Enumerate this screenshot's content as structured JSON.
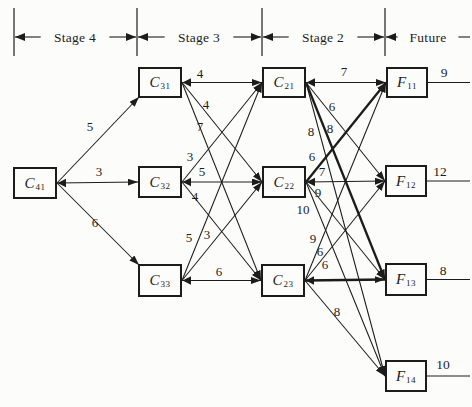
{
  "diagram": {
    "colors": {
      "ink": "#1c1c1c",
      "paper": "#fcfcfa"
    },
    "header": {
      "axis_y": 37,
      "tick_top": 8,
      "tick_bottom": 56,
      "ticks_x": [
        14,
        137,
        262,
        385
      ],
      "right_edge": 470,
      "segments": [
        {
          "label": "Stage 4",
          "from": 14,
          "to": 137,
          "cx": 75,
          "arrows": "both"
        },
        {
          "label": "Stage 3",
          "from": 137,
          "to": 262,
          "cx": 199,
          "arrows": "both"
        },
        {
          "label": "Stage 2",
          "from": 262,
          "to": 385,
          "cx": 323,
          "arrows": "both"
        },
        {
          "label": "Future",
          "from": 385,
          "to": 470,
          "cx": 428,
          "arrows": "left"
        }
      ]
    },
    "nodes": [
      {
        "id": "C41",
        "main": "C",
        "sub": "41",
        "x": 13,
        "y": 167,
        "w": 44,
        "h": 32
      },
      {
        "id": "C31",
        "main": "C",
        "sub": "31",
        "x": 138,
        "y": 67,
        "w": 44,
        "h": 31
      },
      {
        "id": "C32",
        "main": "C",
        "sub": "32",
        "x": 138,
        "y": 166,
        "w": 44,
        "h": 32
      },
      {
        "id": "C33",
        "main": "C",
        "sub": "33",
        "x": 138,
        "y": 264,
        "w": 44,
        "h": 33
      },
      {
        "id": "C21",
        "main": "C",
        "sub": "21",
        "x": 262,
        "y": 67,
        "w": 44,
        "h": 31
      },
      {
        "id": "C22",
        "main": "C",
        "sub": "22",
        "x": 262,
        "y": 166,
        "w": 44,
        "h": 32
      },
      {
        "id": "C23",
        "main": "C",
        "sub": "23",
        "x": 261,
        "y": 264,
        "w": 44,
        "h": 33
      },
      {
        "id": "F11",
        "main": "F",
        "sub": "11",
        "x": 386,
        "y": 67,
        "w": 42,
        "h": 31
      },
      {
        "id": "F12",
        "main": "F",
        "sub": "12",
        "x": 385,
        "y": 165,
        "w": 42,
        "h": 32
      },
      {
        "id": "F13",
        "main": "F",
        "sub": "13",
        "x": 385,
        "y": 263,
        "w": 42,
        "h": 33
      },
      {
        "id": "F14",
        "main": "F",
        "sub": "14",
        "x": 385,
        "y": 360,
        "w": 42,
        "h": 32
      }
    ],
    "edges": [
      {
        "from": "C41",
        "to": "C31",
        "label": "5",
        "lx": 90,
        "ly": 126,
        "anchor": "bl"
      },
      {
        "from": "C41",
        "to": "C32",
        "label": "3",
        "lx": 99,
        "ly": 171
      },
      {
        "from": "C41",
        "to": "C33",
        "label": "6",
        "lx": 95,
        "ly": 222,
        "anchor": "tl"
      },
      {
        "from": "C31",
        "to": "C21",
        "label": "4",
        "lx": 200,
        "ly": 73
      },
      {
        "from": "C31",
        "to": "C22",
        "label": "4",
        "lx": 206,
        "ly": 104
      },
      {
        "from": "C31",
        "to": "C23",
        "label": "7",
        "lx": 200,
        "ly": 126
      },
      {
        "from": "C32",
        "to": "C21",
        "label": "3",
        "lx": 190,
        "ly": 156
      },
      {
        "from": "C32",
        "to": "C22",
        "label": "5",
        "lx": 202,
        "ly": 171
      },
      {
        "from": "C32",
        "to": "C23",
        "label": "4",
        "lx": 195,
        "ly": 196
      },
      {
        "from": "C33",
        "to": "C21",
        "label": "5",
        "lx": 189,
        "ly": 237
      },
      {
        "from": "C33",
        "to": "C22",
        "label": "3",
        "lx": 207,
        "ly": 234
      },
      {
        "from": "C33",
        "to": "C23",
        "label": "6",
        "lx": 219,
        "ly": 271
      },
      {
        "from": "C21",
        "to": "F11",
        "label": "7",
        "lx": 344,
        "ly": 71
      },
      {
        "from": "C21",
        "to": "F12",
        "label": "6",
        "lx": 332,
        "ly": 106
      },
      {
        "from": "C21",
        "to": "F13",
        "label": "8",
        "lx": 330,
        "ly": 128,
        "thick": true
      },
      {
        "from": "C21",
        "to": "F14",
        "label": "8",
        "lx": 311,
        "ly": 131
      },
      {
        "from": "C22",
        "to": "F11",
        "label": "6",
        "lx": 312,
        "ly": 156,
        "thick": true
      },
      {
        "from": "C22",
        "to": "F12",
        "label": "7",
        "lx": 322,
        "ly": 171
      },
      {
        "from": "C22",
        "to": "F13",
        "label": "9",
        "lx": 318,
        "ly": 192
      },
      {
        "from": "C22",
        "to": "F14",
        "label": "10",
        "lx": 303,
        "ly": 209
      },
      {
        "from": "C23",
        "to": "F11",
        "label": "9",
        "lx": 313,
        "ly": 238
      },
      {
        "from": "C23",
        "to": "F12",
        "label": "6",
        "lx": 320,
        "ly": 251
      },
      {
        "from": "C23",
        "to": "F13",
        "label": "6",
        "lx": 325,
        "ly": 264,
        "thick": true
      },
      {
        "from": "C23",
        "to": "F14",
        "label": "8",
        "lx": 337,
        "ly": 311
      }
    ],
    "future_values": [
      {
        "node": "F11",
        "value": "9",
        "lx": 444,
        "ly": 72
      },
      {
        "node": "F12",
        "value": "12",
        "lx": 440,
        "ly": 171
      },
      {
        "node": "F13",
        "value": "8",
        "lx": 443,
        "ly": 270
      },
      {
        "node": "F14",
        "value": "10",
        "lx": 443,
        "ly": 364
      }
    ]
  }
}
